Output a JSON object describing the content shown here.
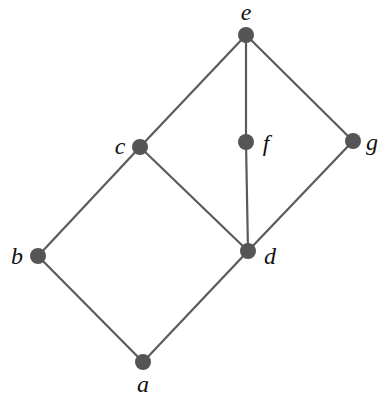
{
  "diagram": {
    "type": "hasse-diagram",
    "nodes": [
      {
        "id": "a",
        "label": "a",
        "x": 143,
        "y": 362,
        "lx": 143,
        "ly": 392,
        "anchor": "middle"
      },
      {
        "id": "b",
        "label": "b",
        "x": 38,
        "y": 256,
        "lx": 17,
        "ly": 264,
        "anchor": "middle"
      },
      {
        "id": "c",
        "label": "c",
        "x": 140,
        "y": 147,
        "lx": 120,
        "ly": 154,
        "anchor": "middle"
      },
      {
        "id": "d",
        "label": "d",
        "x": 248,
        "y": 251,
        "lx": 270,
        "ly": 264,
        "anchor": "middle"
      },
      {
        "id": "e",
        "label": "e",
        "x": 246,
        "y": 35,
        "lx": 246,
        "ly": 20,
        "anchor": "middle"
      },
      {
        "id": "f",
        "label": "f",
        "x": 246,
        "y": 142,
        "lx": 266,
        "ly": 151,
        "anchor": "middle"
      },
      {
        "id": "g",
        "label": "g",
        "x": 353,
        "y": 141,
        "lx": 372,
        "ly": 150,
        "anchor": "middle"
      }
    ],
    "edges": [
      [
        "a",
        "b"
      ],
      [
        "a",
        "d"
      ],
      [
        "b",
        "c"
      ],
      [
        "c",
        "d"
      ],
      [
        "c",
        "e"
      ],
      [
        "d",
        "f"
      ],
      [
        "d",
        "g"
      ],
      [
        "f",
        "e"
      ],
      [
        "g",
        "e"
      ]
    ],
    "colors": {
      "node": "#555555",
      "edge": "#5a5a5a",
      "label": "#111111"
    }
  }
}
